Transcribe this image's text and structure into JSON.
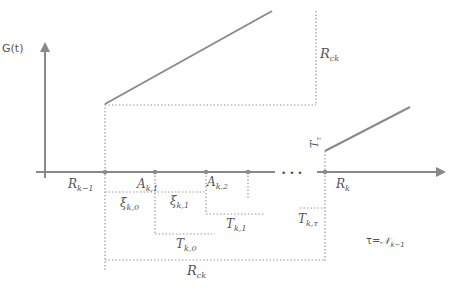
{
  "diagram": {
    "y_axis_label": "G(t)",
    "axis_labels": {
      "r_k_minus_1": "R",
      "r_k_minus_1_sub": "k−1",
      "a_k1": "A",
      "a_k1_sub": "k,1",
      "a_k2": "A",
      "a_k2_sub": "k,2",
      "ellipsis": "• • •",
      "r_k": "R",
      "r_k_sub": "k"
    },
    "interval_labels": {
      "xi_k0": "ξ",
      "xi_k0_sub": "k,0",
      "xi_k1": "ξ",
      "xi_k1_sub": "k,1",
      "t_k0": "T",
      "t_k0_sub": "k,0",
      "t_k1": "T",
      "t_k1_sub": "k,1",
      "t_ktau": "T",
      "t_ktau_sub": "k,τ",
      "r_ck_bottom": "R",
      "r_ck_bottom_sub": "ck",
      "r_ck_right": "R",
      "r_ck_right_sub": "ck",
      "t_tau_vertical": "T",
      "t_tau_vertical_sub": "τ"
    },
    "note": {
      "lhs": "τ=",
      "rhs": "𝒩",
      "rhs_sub": "k−1"
    }
  }
}
